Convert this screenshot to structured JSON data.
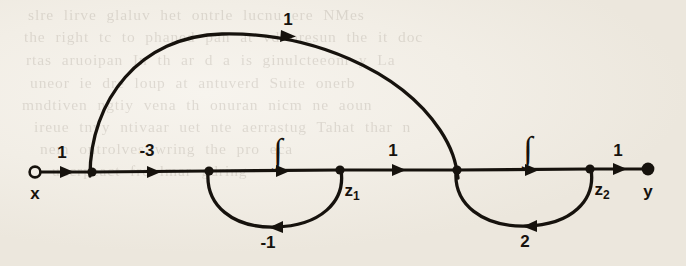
{
  "figure": {
    "kind": "signal-flow-graph",
    "ink_color": "#16120d",
    "paper_color": "#f2eee6",
    "width": 686,
    "height": 266,
    "baseline_y": 170
  },
  "nodes": [
    {
      "id": "x",
      "label": "x",
      "x": 35,
      "y": 172,
      "style": "open",
      "radius": 5.5,
      "label_dx": 0,
      "label_dy": 26
    },
    {
      "id": "n1",
      "label": "",
      "x": 92,
      "y": 172,
      "style": "filled",
      "radius": 4.5,
      "label_dx": 0,
      "label_dy": 0
    },
    {
      "id": "n2",
      "label": "",
      "x": 209,
      "y": 171,
      "style": "filled",
      "radius": 4.5,
      "label_dx": 0,
      "label_dy": 0
    },
    {
      "id": "z1",
      "label": "z",
      "sub": "1",
      "x": 340,
      "y": 170,
      "style": "filled",
      "radius": 4.5,
      "label_dx": 10,
      "label_dy": 24
    },
    {
      "id": "n3",
      "label": "",
      "x": 457,
      "y": 170,
      "style": "filled",
      "radius": 4.5,
      "label_dx": 0,
      "label_dy": 0
    },
    {
      "id": "z2",
      "label": "z",
      "sub": "2",
      "x": 590,
      "y": 169,
      "style": "filled",
      "radius": 4.5,
      "label_dx": 10,
      "label_dy": 24
    },
    {
      "id": "y",
      "label": "y",
      "x": 648,
      "y": 169,
      "style": "filled",
      "radius": 6.5,
      "label_dx": 0,
      "label_dy": 26
    }
  ],
  "edges": [
    {
      "id": "e-x-n1",
      "from": "x",
      "to": "n1",
      "label": "1",
      "shape": "straight",
      "label_x": 62,
      "label_y": 152,
      "arrow_x": 68,
      "arrow_y": 172,
      "arrow_dir": "right"
    },
    {
      "id": "e-n1-n2",
      "from": "n1",
      "to": "n2",
      "label": "-3",
      "shape": "straight",
      "label_x": 146,
      "label_y": 150,
      "arrow_x": 155,
      "arrow_y": 172,
      "arrow_dir": "right"
    },
    {
      "id": "e-n2-z1",
      "from": "n2",
      "to": "z1",
      "label": "∫",
      "shape": "straight",
      "label_x": 277,
      "label_y": 146,
      "arrow_x": 284,
      "arrow_y": 171,
      "arrow_dir": "right"
    },
    {
      "id": "e-z1-n3",
      "from": "z1",
      "to": "n3",
      "label": "1",
      "shape": "straight",
      "label_x": 393,
      "label_y": 150,
      "arrow_x": 400,
      "arrow_y": 170,
      "arrow_dir": "right"
    },
    {
      "id": "e-n3-z2",
      "from": "n3",
      "to": "z2",
      "label": "∫",
      "shape": "straight",
      "label_x": 527,
      "label_y": 144,
      "arrow_x": 533,
      "arrow_y": 170,
      "arrow_dir": "right"
    },
    {
      "id": "e-z2-y",
      "from": "z2",
      "to": "y",
      "label": "1",
      "shape": "straight",
      "label_x": 618,
      "label_y": 150,
      "arrow_x": 621,
      "arrow_y": 169,
      "arrow_dir": "right"
    },
    {
      "id": "e-n1-n3-arc",
      "from": "n1",
      "to": "n3",
      "label": "1",
      "shape": "arc-above",
      "label_x": 288,
      "label_y": 18,
      "arrow_x": 289,
      "arrow_y": 36,
      "arrow_dir": "right"
    },
    {
      "id": "e-z1-n2-loop",
      "from": "z1",
      "to": "n2",
      "label": "-1",
      "shape": "arc-below",
      "label_x": 268,
      "label_y": 238,
      "arrow_x": 275,
      "arrow_y": 232,
      "arrow_dir": "left"
    },
    {
      "id": "e-z2-n3-loop",
      "from": "z2",
      "to": "n3",
      "label": "2",
      "shape": "arc-below",
      "label_x": 525,
      "label_y": 237,
      "arrow_x": 530,
      "arrow_y": 231,
      "arrow_dir": "left"
    }
  ],
  "bleed_text": {
    "note": "faint show-through text from reverse of the scanned page",
    "lines": [
      {
        "x": 28,
        "y": 2,
        "text": "slre lirve glaluv   het     ontrle lucnu   ere    NMes"
      },
      {
        "x": 24,
        "y": 24,
        "text": "the right tc to  phaned   pan at vd oresun the  it doc"
      },
      {
        "x": 26,
        "y": 47,
        "text": "rtas aruoipan In th  ar  d  a is  ginulcteeom  y   La"
      },
      {
        "x": 30,
        "y": 70,
        "text": "uneor  ie  dre    loup at  antuverd  Suite  onerb"
      },
      {
        "x": 22,
        "y": 92,
        "text": "mndtiven    ngtiy    vena th  onuran  nicm  ne  aoun"
      },
      {
        "x": 34,
        "y": 114,
        "text": "ireue tnvy  ntivaar  uet  nte  aerrastug  Tahat  thar  n"
      },
      {
        "x": 40,
        "y": 136,
        "text": "nem  ontrolves  wring  the  pro  eca"
      },
      {
        "x": 52,
        "y": 158,
        "text": "uncrpeact  fre lmar  gdring"
      }
    ]
  }
}
